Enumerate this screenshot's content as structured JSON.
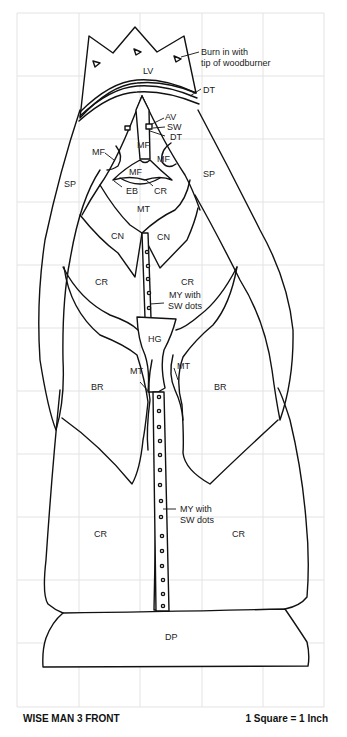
{
  "pattern": {
    "title": "WISE MAN 3 FRONT",
    "scale_note": "1 Square = 1 Inch",
    "grid": {
      "columns": 5,
      "rows": 11,
      "unit": "1 inch per square"
    },
    "line_color": "#111111",
    "grid_color": "#e3e3e3"
  },
  "labels": {
    "crown": "LV",
    "burn_note_line1": "Burn in with",
    "burn_note_line2": "tip of woodburner",
    "band": "DT",
    "eye_av": "AV",
    "eye_sw": "SW",
    "eye_dt": "DT",
    "nose": "MF",
    "cheek_left": "MF",
    "cheek_right": "MF",
    "mouth": "MF",
    "eyebrow": "EB",
    "lip": "CR",
    "beard": "MT",
    "shawl_left": "SP",
    "shawl_right": "SP",
    "collar_left": "CN",
    "collar_right": "CN",
    "robe_upper_left": "CR",
    "robe_upper_right": "CR",
    "placket_upper_line1": "MY with",
    "placket_upper_line2": "SW dots",
    "hands": "HG",
    "cuff_left": "MT",
    "cuff_right": "MT",
    "sleeve_left": "BR",
    "sleeve_right": "BR",
    "placket_lower_line1": "MY with",
    "placket_lower_line2": "SW dots",
    "robe_lower_left": "CR",
    "robe_lower_right": "CR",
    "base": "DP"
  }
}
